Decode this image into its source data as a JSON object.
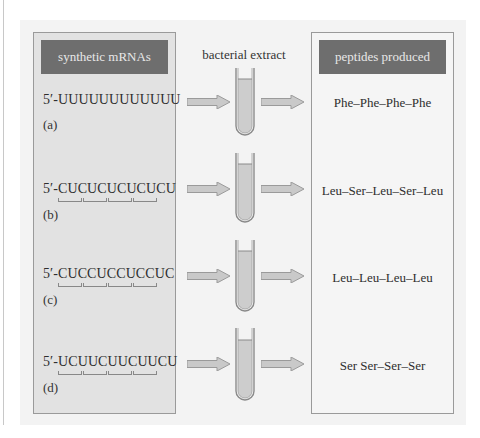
{
  "diagram": {
    "left_column": {
      "header": "synthetic mRNAs",
      "rows": [
        {
          "sequence": "5′-UUUUUUUUUUUU",
          "label": "(a)",
          "codon_brackets": 0
        },
        {
          "sequence": "5′-CUCUCUCUCUCU",
          "label": "(b)",
          "codon_brackets": 4
        },
        {
          "sequence": "5′-CUCCUCCUCCUC",
          "label": "(c)",
          "codon_brackets": 4
        },
        {
          "sequence": "5′-UCUUCUUCUUCU",
          "label": "(d)",
          "codon_brackets": 4
        }
      ]
    },
    "middle_column": {
      "header": "bacterial extract",
      "icons": [
        "arrow-right-icon",
        "test-tube-icon",
        "arrow-right-icon"
      ]
    },
    "right_column": {
      "header": "peptides produced",
      "rows": [
        {
          "peptide": "Phe–Phe–Phe–Phe"
        },
        {
          "peptide": "Leu–Ser–Leu–Ser–Leu"
        },
        {
          "peptide": "Leu–Leu–Leu–Leu"
        },
        {
          "peptide": "Ser  Ser–Ser–Ser"
        }
      ]
    },
    "colors": {
      "header_bar": "#6e6e6e",
      "header_text": "#e8e8e8",
      "left_box": "#e2e2e2",
      "right_box": "#f5f5f5",
      "panel": "#f3f3f3",
      "arrow_fill": "#c9c9c9",
      "tube_fill": "#cdcdcd"
    }
  }
}
